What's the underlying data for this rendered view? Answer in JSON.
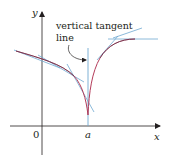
{
  "figure": {
    "axis_labels": {
      "y": "y",
      "x": "x",
      "origin": "0",
      "point_a": "a"
    },
    "annotation": {
      "line1": "vertical tangent",
      "line2": "line"
    },
    "colors": {
      "axes": "#231f20",
      "curve": "#b43c5a",
      "curve_dark": "#3a2a40",
      "tangent": "#6fa8d0",
      "text": "#231f20"
    }
  }
}
